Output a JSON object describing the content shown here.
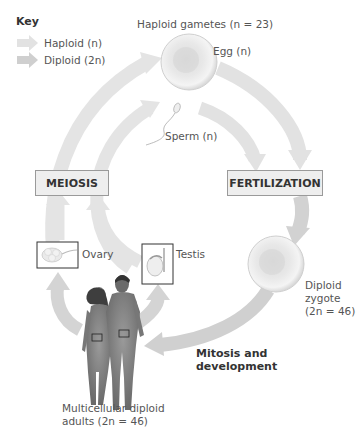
{
  "key": {
    "title": "Key",
    "items": [
      {
        "label": "Haploid (n)",
        "color": "#e2e2e2"
      },
      {
        "label": "Diploid (2n)",
        "color": "#cfcfcf"
      }
    ]
  },
  "cycle": {
    "gametes_label": "Haploid gametes (n = 23)",
    "egg_label": "Egg (n)",
    "sperm_label": "Sperm (n)",
    "meiosis_label": "MEIOSIS",
    "fertilization_label": "FERTILIZATION",
    "ovary_label": "Ovary",
    "testis_label": "Testis",
    "zygote_label_line1": "Diploid",
    "zygote_label_line2": "zygote",
    "zygote_label_line3": "(2n = 46)",
    "mitosis_label_line1": "Mitosis and",
    "mitosis_label_line2": "development",
    "adults_label_line1": "Multicellular diploid",
    "adults_label_line2": "adults (2n = 46)"
  },
  "colors": {
    "haploid_arrow": "#e2e2e2",
    "diploid_arrow": "#cfcfcf",
    "box_fill": "#eeeeee",
    "box_border": "#9a9a9a"
  }
}
